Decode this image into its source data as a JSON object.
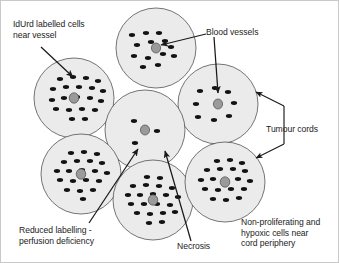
{
  "figure": {
    "background_color": "#ffffff",
    "border_color": "#c9c9c9",
    "cord_fill_color": "#ebebeb",
    "cord_stroke_color": "#3c3c3c",
    "cell_color": "#121212",
    "vessel_color": "#9a9a9a",
    "arrow_color": "#1a1a1a",
    "text_color": "#1c1c1c"
  },
  "labels": {
    "idurd": {
      "line1": "IdUrd labelled cells",
      "line2": "near vessel",
      "x": 12,
      "y": 18
    },
    "blood_vessels": {
      "line1": "Blood vessels",
      "x": 205,
      "y": 26
    },
    "tumour_cords": {
      "line1": "Tumour cords",
      "x": 265,
      "y": 123
    },
    "reduced_labelling": {
      "line1": "Reduced labelling -",
      "line2": "perfusion deficiency",
      "x": 18,
      "y": 224
    },
    "necrosis": {
      "line1": "Necrosis",
      "x": 176,
      "y": 240
    },
    "hypoxic": {
      "line1": "Non-proliferating and",
      "line2": "hypoxic cells near",
      "line3": "cord periphery",
      "x": 240,
      "y": 216
    }
  },
  "cords": [
    {
      "name": "top-cord",
      "cx": 155,
      "cy": 47,
      "r": 40,
      "vessel_rx": 4.6,
      "vessel_ry": 5.0,
      "cells": [
        [
          -24,
          -13
        ],
        [
          -10,
          -15
        ],
        [
          3,
          -15
        ],
        [
          -19,
          -3
        ],
        [
          -5,
          -6
        ],
        [
          9,
          -7
        ],
        [
          -22,
          8
        ],
        [
          -8,
          10
        ],
        [
          7,
          6
        ],
        [
          15,
          -1
        ],
        [
          18,
          8
        ],
        [
          2,
          17
        ],
        [
          -13,
          19
        ]
      ]
    },
    {
      "name": "left-cord",
      "cx": 73,
      "cy": 97,
      "r": 40,
      "vessel_rx": 4.8,
      "vessel_ry": 5.2,
      "cells": [
        [
          -14,
          -19
        ],
        [
          -1,
          -21
        ],
        [
          12,
          -20
        ],
        [
          24,
          -17
        ],
        [
          -21,
          -9
        ],
        [
          -8,
          -11
        ],
        [
          5,
          -11
        ],
        [
          18,
          -10
        ],
        [
          29,
          -7
        ],
        [
          -22,
          2
        ],
        [
          -10,
          0
        ],
        [
          3,
          -1
        ],
        [
          16,
          0
        ],
        [
          27,
          3
        ],
        [
          -18,
          11
        ],
        [
          -5,
          12
        ],
        [
          8,
          11
        ],
        [
          21,
          12
        ],
        [
          -2,
          21
        ],
        [
          11,
          21
        ]
      ]
    },
    {
      "name": "right-upper-cord",
      "cx": 217,
      "cy": 103,
      "r": 40,
      "vessel_rx": 4.6,
      "vessel_ry": 5.0,
      "cells": [
        [
          -18,
          -13
        ],
        [
          -3,
          -16
        ],
        [
          10,
          -12
        ],
        [
          -22,
          0
        ],
        [
          16,
          -1
        ],
        [
          -20,
          13
        ],
        [
          -4,
          16
        ],
        [
          11,
          12
        ]
      ]
    },
    {
      "name": "center-cord",
      "cx": 144,
      "cy": 129,
      "r": 40,
      "vessel_rx": 4.6,
      "vessel_ry": 5.0,
      "cells": [
        [
          -11,
          -9
        ],
        [
          12,
          1
        ],
        [
          -10,
          13
        ]
      ]
    },
    {
      "name": "bottom-left-cord",
      "cx": 80,
      "cy": 173,
      "r": 40,
      "vessel_rx": 4.8,
      "vessel_ry": 5.2,
      "cells": [
        [
          -10,
          -21
        ],
        [
          3,
          -22
        ],
        [
          16,
          -20
        ],
        [
          -17,
          -12
        ],
        [
          -4,
          -13
        ],
        [
          9,
          -13
        ],
        [
          21,
          -11
        ],
        [
          -24,
          -3
        ],
        [
          -12,
          -3
        ],
        [
          1,
          -4
        ],
        [
          14,
          -3
        ],
        [
          26,
          -1
        ],
        [
          -21,
          6
        ],
        [
          -8,
          7
        ],
        [
          5,
          6
        ],
        [
          18,
          7
        ],
        [
          -14,
          16
        ],
        [
          -1,
          17
        ],
        [
          12,
          16
        ],
        [
          2,
          25
        ]
      ]
    },
    {
      "name": "bottom-center-cord",
      "cx": 152,
      "cy": 199,
      "r": 40,
      "vessel_rx": 4.8,
      "vessel_ry": 5.2,
      "cells": [
        [
          -6,
          -23
        ],
        [
          7,
          -22
        ],
        [
          -20,
          -14
        ],
        [
          -7,
          -15
        ],
        [
          6,
          -14
        ],
        [
          19,
          -12
        ],
        [
          -25,
          -5
        ],
        [
          -13,
          -5
        ],
        [
          0,
          -6
        ],
        [
          13,
          -5
        ],
        [
          25,
          -3
        ],
        [
          -22,
          4
        ],
        [
          -9,
          4
        ],
        [
          4,
          4
        ],
        [
          17,
          5
        ],
        [
          -16,
          13
        ],
        [
          -3,
          14
        ],
        [
          10,
          13
        ],
        [
          22,
          12
        ],
        [
          -4,
          23
        ],
        [
          9,
          22
        ]
      ]
    },
    {
      "name": "bottom-right-cord",
      "cx": 224,
      "cy": 181,
      "r": 40,
      "vessel_rx": 4.8,
      "vessel_ry": 5.2,
      "cells": [
        [
          -8,
          -21
        ],
        [
          5,
          -22
        ],
        [
          17,
          -19
        ],
        [
          -18,
          -12
        ],
        [
          -5,
          -13
        ],
        [
          8,
          -13
        ],
        [
          20,
          -11
        ],
        [
          -24,
          -2
        ],
        [
          -12,
          -3
        ],
        [
          13,
          -3
        ],
        [
          25,
          -1
        ],
        [
          -20,
          7
        ],
        [
          -7,
          8
        ],
        [
          6,
          7
        ],
        [
          19,
          7
        ],
        [
          -12,
          17
        ],
        [
          1,
          18
        ],
        [
          14,
          16
        ]
      ]
    }
  ],
  "arrows": [
    {
      "name": "idurd-arrow",
      "from": [
        40,
        46
      ],
      "to": [
        72,
        76
      ]
    },
    {
      "name": "blood-vessels-arrow-top",
      "from": [
        205,
        33
      ],
      "to": [
        160,
        44
      ]
    },
    {
      "name": "blood-vessels-arrow-right",
      "from": [
        213,
        36
      ],
      "to": [
        217,
        92
      ]
    },
    {
      "name": "reduced-labelling-arrow",
      "from": [
        88,
        222
      ],
      "to": [
        137,
        148
      ]
    },
    {
      "name": "necrosis-arrow",
      "from": [
        190,
        240
      ],
      "to": [
        164,
        150
      ]
    }
  ],
  "bracket": {
    "name": "tumour-cords-bracket",
    "stem_x": 283,
    "top_y": 105,
    "bottom_y": 143,
    "upper_arrow_to": [
      255,
      91
    ],
    "lower_arrow_to": [
      255,
      157
    ]
  }
}
